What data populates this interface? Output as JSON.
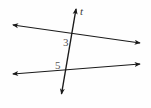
{
  "figure": {
    "background_color": "#fefefe",
    "stroke_color": "#1a1a1a",
    "label_color": "#555555",
    "width": 151,
    "height": 108,
    "labels": {
      "transversal_name": "t",
      "angle_upper": "3",
      "angle_lower": "5"
    },
    "lines": [
      {
        "name": "transversal",
        "label": "t",
        "x1": 76,
        "y1": 8,
        "x2": 61,
        "y2": 95,
        "arrow_start": true,
        "arrow_end": true
      },
      {
        "name": "upper-parallel",
        "label": "",
        "x1": 13,
        "y1": 25,
        "x2": 140,
        "y2": 43,
        "arrow_start": true,
        "arrow_end": true
      },
      {
        "name": "lower-parallel",
        "label": "",
        "x1": 13,
        "y1": 74,
        "x2": 140,
        "y2": 64,
        "arrow_start": true,
        "arrow_end": true
      }
    ],
    "intersections": [
      {
        "name": "upper-intersection",
        "x": 72,
        "y": 35
      },
      {
        "name": "lower-intersection",
        "x": 66,
        "y": 70
      }
    ]
  }
}
